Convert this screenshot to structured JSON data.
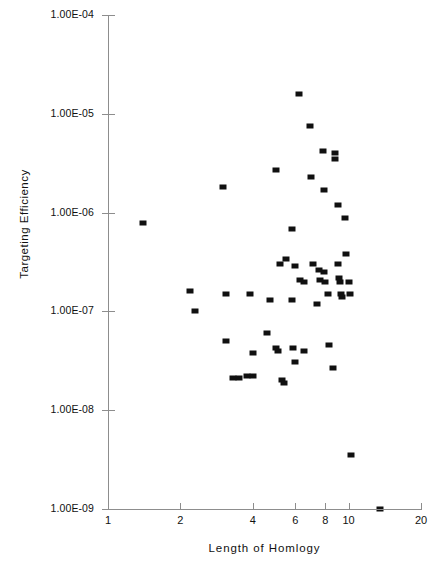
{
  "chart_data": {
    "type": "scatter",
    "title": "",
    "xlabel": "Length of Homlogy",
    "ylabel": "Targeting Efficiency",
    "xscale": "log",
    "yscale": "log",
    "xlim": [
      1,
      20
    ],
    "ylim": [
      1e-09,
      0.0001
    ],
    "grid": false,
    "legend": null,
    "marker": {
      "shape": "square",
      "color": "#101010",
      "size_px": 6
    },
    "axis_color": "#8d8d8d",
    "x_tick_labels": [
      "1",
      "2",
      "4",
      "6",
      "8",
      "10",
      "20"
    ],
    "x_tick_values": [
      1,
      2,
      4,
      6,
      8,
      10,
      20
    ],
    "y_tick_labels": [
      "1.00E-04",
      "1.00E-05",
      "1.00E-06",
      "1.00E-07",
      "1.00E-08",
      "1.00E-09"
    ],
    "y_tick_values": [
      0.0001,
      1e-05,
      1e-06,
      1e-07,
      1e-08,
      1e-09
    ],
    "n_points": 57,
    "points": [
      {
        "x": 1.4,
        "y": 7.8e-07
      },
      {
        "x": 2.2,
        "y": 1.6e-07
      },
      {
        "x": 2.3,
        "y": 1e-07
      },
      {
        "x": 3.0,
        "y": 1.8e-06
      },
      {
        "x": 3.1,
        "y": 1.5e-07
      },
      {
        "x": 3.1,
        "y": 5e-08
      },
      {
        "x": 3.3,
        "y": 2.1e-08
      },
      {
        "x": 3.5,
        "y": 2.1e-08
      },
      {
        "x": 3.8,
        "y": 2.2e-08
      },
      {
        "x": 3.9,
        "y": 1.5e-07
      },
      {
        "x": 4.0,
        "y": 3.8e-08
      },
      {
        "x": 4.0,
        "y": 2.2e-08
      },
      {
        "x": 4.6,
        "y": 6e-08
      },
      {
        "x": 4.7,
        "y": 1.3e-07
      },
      {
        "x": 5.0,
        "y": 2.7e-06
      },
      {
        "x": 5.0,
        "y": 4.3e-08
      },
      {
        "x": 5.1,
        "y": 4e-08
      },
      {
        "x": 5.2,
        "y": 3e-07
      },
      {
        "x": 5.3,
        "y": 2e-08
      },
      {
        "x": 5.4,
        "y": 1.9e-08
      },
      {
        "x": 5.5,
        "y": 3.4e-07
      },
      {
        "x": 5.8,
        "y": 6.8e-07
      },
      {
        "x": 5.8,
        "y": 1.3e-07
      },
      {
        "x": 5.9,
        "y": 4.3e-08
      },
      {
        "x": 6.0,
        "y": 2.9e-07
      },
      {
        "x": 6.0,
        "y": 3.1e-08
      },
      {
        "x": 6.2,
        "y": 1.6e-05
      },
      {
        "x": 6.3,
        "y": 2.1e-07
      },
      {
        "x": 6.5,
        "y": 2e-07
      },
      {
        "x": 6.5,
        "y": 4e-08
      },
      {
        "x": 6.9,
        "y": 7.5e-06
      },
      {
        "x": 7.0,
        "y": 2.3e-06
      },
      {
        "x": 7.1,
        "y": 3e-07
      },
      {
        "x": 7.4,
        "y": 1.2e-07
      },
      {
        "x": 7.5,
        "y": 2.6e-07
      },
      {
        "x": 7.6,
        "y": 2.1e-07
      },
      {
        "x": 7.8,
        "y": 4.2e-06
      },
      {
        "x": 7.9,
        "y": 1.7e-06
      },
      {
        "x": 7.9,
        "y": 2.5e-07
      },
      {
        "x": 8.0,
        "y": 2e-07
      },
      {
        "x": 8.2,
        "y": 1.5e-07
      },
      {
        "x": 8.3,
        "y": 4.6e-08
      },
      {
        "x": 8.6,
        "y": 2.7e-08
      },
      {
        "x": 8.8,
        "y": 4e-06
      },
      {
        "x": 8.8,
        "y": 3.5e-06
      },
      {
        "x": 9.0,
        "y": 1.2e-06
      },
      {
        "x": 9.0,
        "y": 3e-07
      },
      {
        "x": 9.1,
        "y": 2.2e-07
      },
      {
        "x": 9.2,
        "y": 2e-07
      },
      {
        "x": 9.3,
        "y": 1.5e-07
      },
      {
        "x": 9.4,
        "y": 1.4e-07
      },
      {
        "x": 9.7,
        "y": 8.8e-07
      },
      {
        "x": 9.8,
        "y": 3.8e-07
      },
      {
        "x": 10.0,
        "y": 2e-07
      },
      {
        "x": 10.1,
        "y": 1.5e-07
      },
      {
        "x": 10.2,
        "y": 3.5e-09
      },
      {
        "x": 13.5,
        "y": 1e-09
      }
    ]
  }
}
